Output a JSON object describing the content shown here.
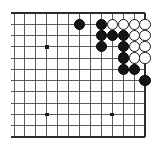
{
  "diagram": {
    "board": {
      "type": "go-board-partial",
      "columns": 13,
      "rows": 12,
      "origin_x": 14,
      "origin_y": 13,
      "step_x": 10.92,
      "step_y": 11.27,
      "line_color": "#4a4a4a",
      "edge_color": "#2b2b2b",
      "background_color": "#ffffff",
      "edges": {
        "top": true,
        "right": true,
        "bottom": true,
        "left": false
      }
    },
    "star_points": [
      {
        "col": 3,
        "row": 3
      },
      {
        "col": 3,
        "row": 9
      },
      {
        "col": 9,
        "row": 9
      }
    ],
    "stones": [
      {
        "color": "black",
        "col": 6,
        "row": 1
      },
      {
        "color": "black",
        "col": 8,
        "row": 1
      },
      {
        "color": "white",
        "col": 9,
        "row": 1
      },
      {
        "color": "white",
        "col": 10,
        "row": 1
      },
      {
        "color": "white",
        "col": 11,
        "row": 1
      },
      {
        "color": "white",
        "col": 12,
        "row": 1
      },
      {
        "color": "black",
        "col": 8,
        "row": 2
      },
      {
        "color": "black",
        "col": 9,
        "row": 2
      },
      {
        "color": "black",
        "col": 10,
        "row": 2
      },
      {
        "color": "white",
        "col": 11,
        "row": 2
      },
      {
        "color": "white",
        "col": 12,
        "row": 2
      },
      {
        "color": "black",
        "col": 8,
        "row": 3
      },
      {
        "color": "black",
        "col": 10,
        "row": 3
      },
      {
        "color": "white",
        "col": 11,
        "row": 3
      },
      {
        "color": "white",
        "col": 12,
        "row": 3
      },
      {
        "color": "black",
        "col": 10,
        "row": 4
      },
      {
        "color": "white",
        "col": 11,
        "row": 4
      },
      {
        "color": "white",
        "col": 12,
        "row": 4
      },
      {
        "color": "black",
        "col": 10,
        "row": 5
      },
      {
        "color": "black",
        "col": 11,
        "row": 5
      },
      {
        "color": "black",
        "col": 12,
        "row": 6
      }
    ],
    "stone_radius": 5.6
  }
}
